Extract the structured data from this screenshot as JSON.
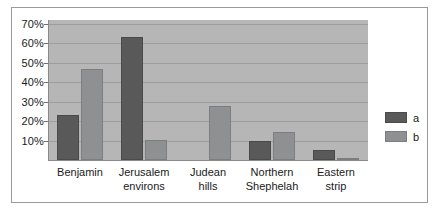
{
  "chart_data": {
    "type": "bar",
    "title": "",
    "xlabel": "",
    "ylabel": "",
    "ylim": [
      0,
      72
    ],
    "yticks": [
      10,
      20,
      30,
      40,
      50,
      60,
      70
    ],
    "ytick_labels": [
      "10%",
      "20%",
      "30%",
      "40%",
      "50%",
      "60%",
      "70%"
    ],
    "grid": true,
    "legend_position": "right",
    "categories": [
      "Benjamin",
      "Jerusalem environs",
      "Judean hills",
      "Northern Shephelah",
      "Eastern strip"
    ],
    "category_lines": [
      [
        "Benjamin"
      ],
      [
        "Jerusalem",
        "environs"
      ],
      [
        "Judean",
        "hills"
      ],
      [
        "Northern",
        "Shephelah"
      ],
      [
        "Eastern",
        "strip"
      ]
    ],
    "series": [
      {
        "name": "a",
        "color": "#59595a",
        "values": [
          23,
          63.5,
          0,
          10,
          5
        ]
      },
      {
        "name": "b",
        "color": "#8f9092",
        "values": [
          47,
          10.5,
          28,
          14.5,
          1
        ]
      }
    ]
  },
  "legend": {
    "entries": [
      {
        "label": "a",
        "color": "#59595a"
      },
      {
        "label": "b",
        "color": "#8f9092"
      }
    ]
  },
  "colors": {
    "plot_background": "#b6b6b6",
    "gridline": "#9d9d9d",
    "axis": "#8a8a8a",
    "frame_border": "#9a9a9a",
    "page_background": "#ffffff",
    "text": "#1a1a1a"
  }
}
